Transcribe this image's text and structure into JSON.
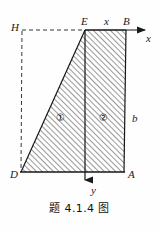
{
  "figure": {
    "caption": "题 4.1.4 图",
    "background_color": "#fefefe",
    "stroke_color": "#1a1a1a",
    "hatch_color": "#3c3c3c",
    "width": 159,
    "height": 230
  },
  "axes": {
    "x_axis": {
      "label": "x",
      "direction": "right",
      "origin": {
        "x": 85,
        "y": 30
      },
      "tip": {
        "x": 152,
        "y": 30
      }
    },
    "y_axis": {
      "label": "y",
      "direction": "down",
      "origin": {
        "x": 85,
        "y": 30
      },
      "tip": {
        "x": 85,
        "y": 188
      }
    }
  },
  "points": {
    "H": {
      "label": "H",
      "x": 22,
      "y": 30
    },
    "E": {
      "label": "E",
      "x": 85,
      "y": 30
    },
    "B": {
      "label": "B",
      "x": 126,
      "y": 30
    },
    "D": {
      "label": "D",
      "x": 21,
      "y": 172
    },
    "A": {
      "label": "A",
      "x": 124,
      "y": 172
    }
  },
  "dimensions": {
    "x_segment": {
      "label": "x",
      "from": "E",
      "to": "B"
    },
    "b_segment": {
      "label": "b",
      "from": "B",
      "to": "A"
    }
  },
  "regions": [
    {
      "label": "①",
      "name": "region-one",
      "x": 60,
      "y": 114
    },
    {
      "label": "②",
      "name": "region-two",
      "x": 103,
      "y": 114
    }
  ],
  "labels": {
    "H": "H",
    "E": "E",
    "B": "B",
    "D": "D",
    "A": "A",
    "x_axis": "x",
    "y_axis": "y",
    "x_dim": "x",
    "b_dim": "b"
  }
}
